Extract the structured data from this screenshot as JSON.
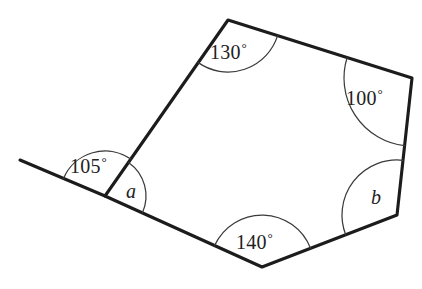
{
  "figure": {
    "type": "geometry-diagram",
    "shape": "pentagon-with-extended-side",
    "width": 422,
    "height": 289,
    "background_color": "#ffffff",
    "line_color": "#1c1c1c",
    "arc_color": "#3a3a3a"
  },
  "vertices": {
    "left": {
      "x": 105,
      "y": 196
    },
    "top": {
      "x": 228,
      "y": 20
    },
    "right_upper": {
      "x": 412,
      "y": 78
    },
    "right_lower": {
      "x": 397,
      "y": 215
    },
    "bottom": {
      "x": 262,
      "y": 267
    },
    "ray_end": {
      "x": 20,
      "y": 160
    }
  },
  "angles": [
    {
      "id": "exterior-left",
      "label": "105",
      "degree_symbol": "°",
      "kind": "numeric",
      "vertex": "left",
      "label_x": 70,
      "label_y": 155,
      "arc_radius": 45
    },
    {
      "id": "interior-left",
      "label": "a",
      "degree_symbol": "",
      "kind": "variable",
      "vertex": "left",
      "label_x": 126,
      "label_y": 180,
      "arc_radius": 41
    },
    {
      "id": "interior-top",
      "label": "130",
      "degree_symbol": "°",
      "kind": "numeric",
      "vertex": "top",
      "label_x": 210,
      "label_y": 41,
      "arc_radius": 52
    },
    {
      "id": "interior-right-upper",
      "label": "100",
      "degree_symbol": "°",
      "kind": "numeric",
      "vertex": "right_upper",
      "label_x": 346,
      "label_y": 87,
      "arc_radius": 68
    },
    {
      "id": "interior-right-lower",
      "label": "b",
      "degree_symbol": "",
      "kind": "variable",
      "vertex": "right_lower",
      "label_x": 371,
      "label_y": 186,
      "arc_radius": 55
    },
    {
      "id": "interior-bottom",
      "label": "140",
      "degree_symbol": "°",
      "kind": "numeric",
      "vertex": "bottom",
      "label_x": 236,
      "label_y": 231,
      "arc_radius": 52
    }
  ]
}
